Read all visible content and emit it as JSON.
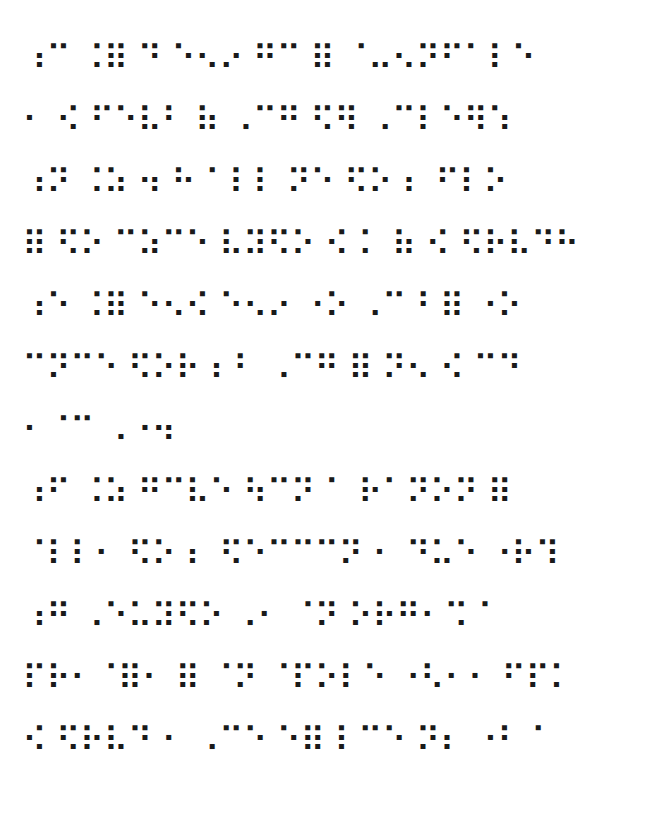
{
  "document": {
    "type": "braille-page",
    "lines": [
      "⠰⠉ ⠨⠿ ⠙ ⠑⠢⠔ ⠛⠉ ⠿ ⠈⠤⠢⠝⠋⠁⠇⠑",
      "⠂ ⠪ ⠋⠑⠧⠃ ⠷ ⠠⠉⠛ ⠫⠻ ⠠⠉⠇⠑⠻⠱",
      "⠰⠝ ⠨⠵ ⠲ ⠓ ⠁⠇⠇ ⠝⠑ ⠫⠕ ⠆ ⠋⠇⠕",
      "⠿ ⠫⠕ ⠉⠵⠉⠑ ⠧⠽⠫⠕ ⠪ ⠅ ⠷ ⠪ ⠫⠗⠧⠙⠓",
      "⠰⠑ ⠨⠿ ⠑⠢⠪ ⠑⠢⠔ ⠐⠕ ⠠⠉⠘ ⠿ ⠐⠕",
      "⠉⠝⠉⠑ ⠫⠕⠗ ⠆⠃ ⠠⠉⠛ ⠿ ⠝⠢ ⠪ ⠉⠙",
      "⠂⠈⠉ ⠠⠐⠲",
      "⠰⠋ ⠨⠵ ⠛⠉⠧⠑ ⠳⠉⠝ ⠁ ⠗⠁⠝⠕⠝ ⠿",
      "⠈⠇⠇⠂ ⠫⠕ ⠆ ⠫⠑⠉⠉⠉⠝ ⠂ ⠙⠥⠑ ⠐⠗⠹",
      "⠰⠛ ⠠⠑⠥⠽⠫⠕ ⠠⠂ ⠈⠝ ⠕⠗⠛⠂⠩ ⠁",
      "⠏⠗⠂⠈⠿⠂ ⠿ ⠈⠝ ⠈⠏⠕⠇⠑ ⠐⠣⠂⠂ ⠋⠏⠅",
      "⠪ ⠫⠗⠧⠙ ⠂ ⠠⠉⠑ ⠑⠿ ⠇⠉⠑ ⠝⠆ ⠐⠃ ⠁"
    ]
  }
}
